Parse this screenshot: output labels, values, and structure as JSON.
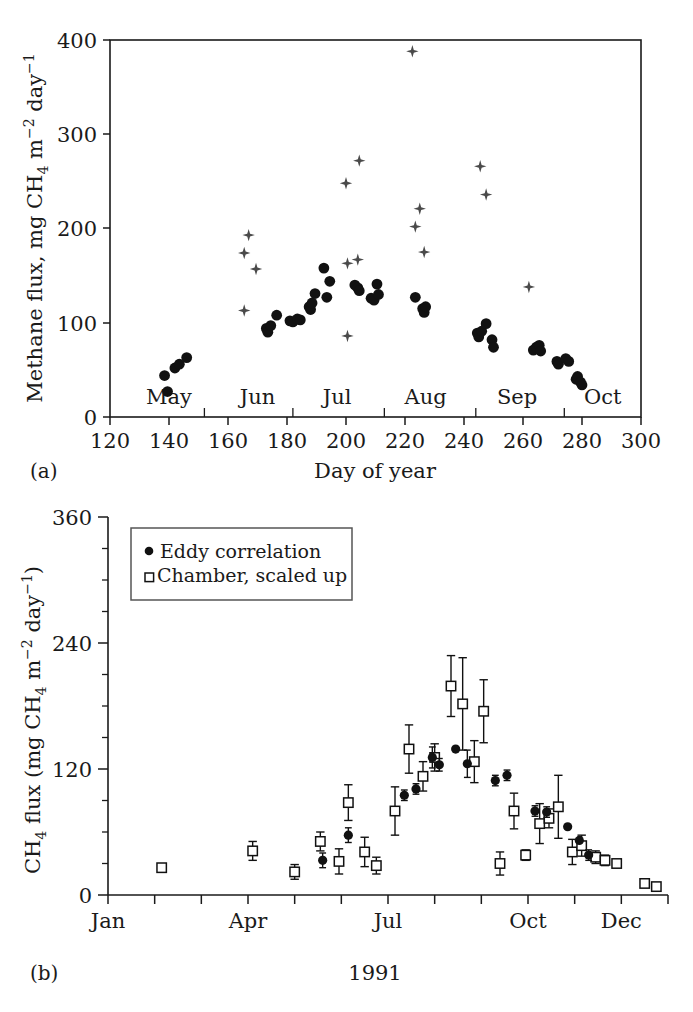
{
  "figure": {
    "panel_a_label": "(a)",
    "panel_b_label": "(b)"
  },
  "panel_a": {
    "ylabel_plain": "Methane flux, mg CH4 m-2 day-1",
    "ylabel_parts": {
      "lead": "Methane flux,  mg CH",
      "sub1": "4",
      "mid": " m",
      "sup1": "−2",
      "mid2": " day",
      "sup2": "−1"
    },
    "xlabel": "Day of year",
    "xticks": [
      120,
      140,
      160,
      180,
      200,
      220,
      240,
      260,
      280,
      300
    ],
    "yticks": [
      0,
      100,
      200,
      300,
      400
    ],
    "xlim": [
      120,
      300
    ],
    "ylim": [
      0,
      400
    ],
    "month_labels": [
      {
        "text": "May",
        "day": 140
      },
      {
        "text": "Jun",
        "day": 170
      },
      {
        "text": "Jul",
        "day": 197
      },
      {
        "text": "Aug",
        "day": 227
      },
      {
        "text": "Sep",
        "day": 258
      },
      {
        "text": "Oct",
        "day": 287
      }
    ],
    "month_tick_days": [
      152,
      182,
      213,
      244,
      274
    ]
  },
  "panel_b": {
    "ylabel_plain": "CH4 flux (mg CH4 m-2 day-1)",
    "ylabel_parts": {
      "lead": "CH",
      "sub1": "4",
      "mid0": " flux (mg CH",
      "sub2": "4",
      "mid": " m",
      "sup1": "−2",
      "mid2": " day",
      "sup2": "−1",
      "tail": ")"
    },
    "xlabel": "1991",
    "yticks": [
      0,
      120,
      240,
      360
    ],
    "yminor_step": 30,
    "ylim": [
      0,
      360
    ],
    "xlim": [
      0,
      12
    ],
    "xticks_labeled": [
      {
        "text": "Jan",
        "month": 0
      },
      {
        "text": "Apr",
        "month": 3
      },
      {
        "text": "Jul",
        "month": 6
      },
      {
        "text": "Oct",
        "month": 9
      },
      {
        "text": "Dec",
        "month": 11
      }
    ],
    "legend": {
      "items": [
        {
          "marker": "filled-circle",
          "label": "Eddy correlation"
        },
        {
          "marker": "open-square",
          "label": "Chamber, scaled up"
        }
      ]
    }
  },
  "chart_data": [
    {
      "type": "scatter",
      "panel": "a",
      "title": "",
      "xlabel": "Day of year",
      "ylabel": "Methane flux, mg CH4 m-2 day-1",
      "xlim": [
        120,
        300
      ],
      "ylim": [
        0,
        400
      ],
      "grid": false,
      "legend_position": "none",
      "series": [
        {
          "name": "eddy-correlation-filled-circles",
          "marker": "filled-circle",
          "points": [
            [
              138.5,
              44
            ],
            [
              139.5,
              27
            ],
            [
              142,
              52
            ],
            [
              143.5,
              56
            ],
            [
              146,
              63
            ],
            [
              173,
              94
            ],
            [
              173.5,
              90
            ],
            [
              174.5,
              97
            ],
            [
              176.5,
              108
            ],
            [
              181,
              102
            ],
            [
              182,
              101
            ],
            [
              183.5,
              104
            ],
            [
              184.5,
              103
            ],
            [
              187.5,
              117
            ],
            [
              188,
              114
            ],
            [
              188.5,
              121
            ],
            [
              189.5,
              131
            ],
            [
              192.5,
              158
            ],
            [
              193.5,
              127
            ],
            [
              194.5,
              144
            ],
            [
              203,
              140
            ],
            [
              204,
              137
            ],
            [
              204.5,
              134
            ],
            [
              208.5,
              126
            ],
            [
              209.5,
              124
            ],
            [
              210.5,
              141
            ],
            [
              211,
              130
            ],
            [
              223.5,
              127
            ],
            [
              226,
              115
            ],
            [
              226.5,
              111
            ],
            [
              227,
              117
            ],
            [
              244.5,
              89
            ],
            [
              245,
              85
            ],
            [
              246,
              91
            ],
            [
              247.5,
              99
            ],
            [
              249.5,
              82
            ],
            [
              250,
              74
            ],
            [
              263.5,
              71
            ],
            [
              264.5,
              74
            ],
            [
              265.5,
              76
            ],
            [
              266,
              70
            ],
            [
              271.5,
              59
            ],
            [
              272,
              56
            ],
            [
              274.5,
              62
            ],
            [
              275.5,
              59
            ],
            [
              278,
              40
            ],
            [
              278.5,
              43
            ],
            [
              279.5,
              37
            ],
            [
              280,
              34
            ]
          ]
        },
        {
          "name": "chamber-cross-markers",
          "marker": "four-point-star",
          "points": [
            [
              165.5,
              113
            ],
            [
              165.5,
              174
            ],
            [
              167,
              193
            ],
            [
              169.5,
              157
            ],
            [
              200,
              248
            ],
            [
              200.5,
              163
            ],
            [
              200.5,
              86
            ],
            [
              204,
              167
            ],
            [
              204.5,
              272
            ],
            [
              222.5,
              388
            ],
            [
              223.5,
              202
            ],
            [
              225,
              221
            ],
            [
              226.5,
              175
            ],
            [
              245.5,
              266
            ],
            [
              247.5,
              236
            ],
            [
              262,
              138
            ]
          ]
        }
      ]
    },
    {
      "type": "scatter",
      "panel": "b",
      "title": "",
      "xlabel": "1991",
      "ylabel": "CH4 flux (mg CH4 m-2 day-1)",
      "xlim": [
        0,
        12
      ],
      "ylim": [
        0,
        360
      ],
      "grid": false,
      "legend_position": "upper-left",
      "series": [
        {
          "name": "Chamber, scaled up",
          "marker": "open-square",
          "points": [
            {
              "x": 1.15,
              "y": 26,
              "err": 0
            },
            {
              "x": 3.1,
              "y": 42,
              "err": 9
            },
            {
              "x": 4.0,
              "y": 22,
              "err": 7
            },
            {
              "x": 4.55,
              "y": 51,
              "err": 9
            },
            {
              "x": 4.95,
              "y": 32,
              "err": 12
            },
            {
              "x": 5.15,
              "y": 88,
              "err": 17
            },
            {
              "x": 5.5,
              "y": 41,
              "err": 14
            },
            {
              "x": 5.75,
              "y": 28,
              "err": 8
            },
            {
              "x": 6.15,
              "y": 80,
              "err": 23
            },
            {
              "x": 6.45,
              "y": 139,
              "err": 23
            },
            {
              "x": 6.75,
              "y": 113,
              "err": 14
            },
            {
              "x": 7.0,
              "y": 131,
              "err": 13
            },
            {
              "x": 7.35,
              "y": 199,
              "err": 29
            },
            {
              "x": 7.6,
              "y": 182,
              "err": 44
            },
            {
              "x": 7.85,
              "y": 127,
              "err": 20
            },
            {
              "x": 8.05,
              "y": 175,
              "err": 30
            },
            {
              "x": 8.4,
              "y": 30,
              "err": 11
            },
            {
              "x": 8.7,
              "y": 80,
              "err": 17
            },
            {
              "x": 8.95,
              "y": 38,
              "err": 5
            },
            {
              "x": 9.25,
              "y": 68,
              "err": 19
            },
            {
              "x": 9.45,
              "y": 73,
              "err": 9
            },
            {
              "x": 9.65,
              "y": 84,
              "err": 30
            },
            {
              "x": 9.95,
              "y": 41,
              "err": 12
            },
            {
              "x": 10.15,
              "y": 47,
              "err": 10
            },
            {
              "x": 10.45,
              "y": 36,
              "err": 6
            },
            {
              "x": 10.65,
              "y": 33,
              "err": 5
            },
            {
              "x": 10.9,
              "y": 30,
              "err": 0
            },
            {
              "x": 11.5,
              "y": 11,
              "err": 0
            },
            {
              "x": 11.75,
              "y": 8,
              "err": 0
            }
          ]
        },
        {
          "name": "Eddy correlation",
          "marker": "filled-circle",
          "points": [
            {
              "x": 4.6,
              "y": 33,
              "err": 7
            },
            {
              "x": 5.15,
              "y": 57,
              "err": 7
            },
            {
              "x": 6.35,
              "y": 95,
              "err": 5
            },
            {
              "x": 6.6,
              "y": 101,
              "err": 5
            },
            {
              "x": 6.95,
              "y": 131,
              "err": 10
            },
            {
              "x": 7.1,
              "y": 124,
              "err": 6
            },
            {
              "x": 7.45,
              "y": 139,
              "err": 0
            },
            {
              "x": 7.7,
              "y": 125,
              "err": 13
            },
            {
              "x": 8.3,
              "y": 109,
              "err": 5
            },
            {
              "x": 8.55,
              "y": 114,
              "err": 5
            },
            {
              "x": 9.15,
              "y": 80,
              "err": 5
            },
            {
              "x": 9.4,
              "y": 79,
              "err": 5
            },
            {
              "x": 9.85,
              "y": 65,
              "err": 0
            },
            {
              "x": 10.1,
              "y": 52,
              "err": 0
            },
            {
              "x": 10.3,
              "y": 38,
              "err": 5
            }
          ]
        }
      ]
    }
  ]
}
